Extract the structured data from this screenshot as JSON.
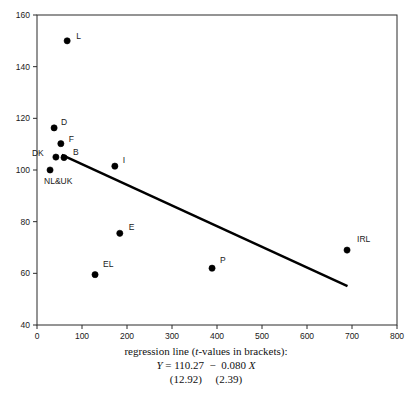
{
  "chart_data": {
    "type": "scatter",
    "title": "",
    "xlabel": "",
    "ylabel": "",
    "xlim": [
      0,
      800
    ],
    "ylim": [
      40,
      160
    ],
    "xticks": [
      0,
      100,
      200,
      300,
      400,
      500,
      600,
      700,
      800
    ],
    "yticks": [
      40,
      60,
      80,
      100,
      120,
      140,
      160
    ],
    "grid": false,
    "legend": "none",
    "points": [
      {
        "label": "L",
        "x": 67,
        "y": 150.0,
        "label_dx": 9,
        "label_dy": -2
      },
      {
        "label": "D",
        "x": 38,
        "y": 116.3,
        "label_dx": 7,
        "label_dy": -3
      },
      {
        "label": "F",
        "x": 53,
        "y": 110.2,
        "label_dx": 8,
        "label_dy": -2
      },
      {
        "label": "DK",
        "x": 42,
        "y": 105.0,
        "label_dx": -24,
        "label_dy": -1
      },
      {
        "label": "B",
        "x": 60,
        "y": 104.8,
        "label_dx": 9,
        "label_dy": -3
      },
      {
        "label": "NL&UK",
        "x": 29,
        "y": 100.0,
        "label_dx": -6,
        "label_dy": 14
      },
      {
        "label": "I",
        "x": 173,
        "y": 101.5,
        "label_dx": 8,
        "label_dy": -3
      },
      {
        "label": "E",
        "x": 184,
        "y": 75.5,
        "label_dx": 9,
        "label_dy": -3
      },
      {
        "label": "EL",
        "x": 129,
        "y": 59.5,
        "label_dx": 8,
        "label_dy": -8
      },
      {
        "label": "P",
        "x": 389,
        "y": 62.0,
        "label_dx": 8,
        "label_dy": -5
      },
      {
        "label": "IRL",
        "x": 689,
        "y": 69.0,
        "label_dx": 10,
        "label_dy": -8
      }
    ],
    "regression_line": {
      "intercept": 110.27,
      "slope": -0.08,
      "x_start": 55,
      "x_end": 690,
      "t_intercept": "12.92",
      "t_slope": "2.39"
    },
    "marker_color": "#000000",
    "line_color": "#000000",
    "axis_color": "#2b2b2b"
  },
  "caption": {
    "line1": "regression line (t-values in brackets):",
    "line1_pre": "regression line (",
    "line1_ital": "t",
    "line1_post": "-values in brackets):",
    "equation_y": "Y",
    "equation_rest": " = 110.27  −  0.080 ",
    "equation_x": "X",
    "tvalues": "(12.92)     (2.39)"
  }
}
